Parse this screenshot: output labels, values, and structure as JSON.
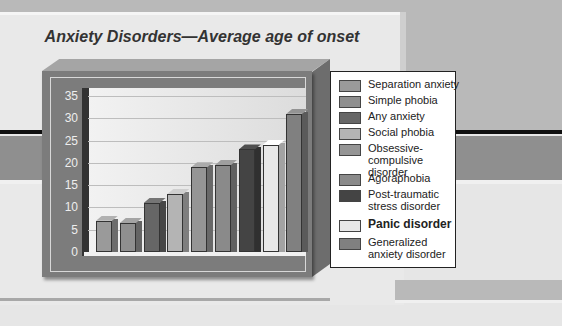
{
  "chart_data": {
    "type": "bar",
    "title": "Anxiety Disorders—Average age of onset",
    "xlabel": "",
    "ylabel": "",
    "ylim": [
      0,
      35
    ],
    "yticks": [
      0,
      5,
      10,
      15,
      20,
      25,
      30,
      35
    ],
    "grid": true,
    "legend_position": "right",
    "categories": [
      "Separation anxiety",
      "Simple phobia",
      "Any anxiety",
      "Social phobia",
      "Obsessive-compulsive disorder",
      "Agoraphobia",
      "Post-traumatic stress disorder",
      "Panic disorder",
      "Generalized anxiety disorder"
    ],
    "values": [
      7,
      6.5,
      11,
      13,
      19,
      19.5,
      23,
      24,
      31
    ],
    "colors": [
      "#9a9a9a",
      "#8f8f8f",
      "#666666",
      "#b4b4b4",
      "#959595",
      "#8a8a8a",
      "#444444",
      "#e8e8e8",
      "#808080"
    ],
    "emphasized": "Panic disorder"
  },
  "title": "Anxiety Disorders—Average age of onset",
  "yticks": [
    "35",
    "30",
    "25",
    "20",
    "15",
    "10",
    "5",
    "0"
  ],
  "legend": [
    {
      "label": "Separation anxiety"
    },
    {
      "label": "Simple phobia"
    },
    {
      "label": "Any anxiety"
    },
    {
      "label": "Social phobia"
    },
    {
      "label": "Obsessive-compulsive disorder"
    },
    {
      "label": "Agoraphobia"
    },
    {
      "label": "Post-traumatic stress disorder"
    },
    {
      "label": "Panic disorder"
    },
    {
      "label": "Generalized anxiety disorder"
    }
  ]
}
